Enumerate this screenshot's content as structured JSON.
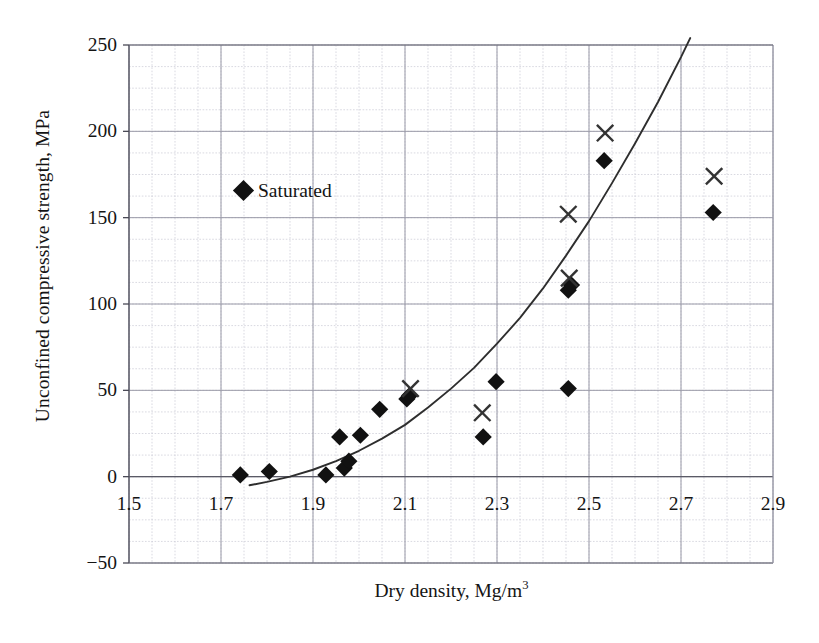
{
  "chart_data": {
    "type": "scatter",
    "title": "",
    "xlabel": "Dry density, Mg/m",
    "xlabel_exponent": "3",
    "ylabel": "Unconfined compressive strength, MPa",
    "xlim": [
      1.5,
      2.9
    ],
    "ylim": [
      -50,
      250
    ],
    "xticks": [
      1.5,
      1.7,
      1.9,
      2.1,
      2.3,
      2.5,
      2.7,
      2.9
    ],
    "xtick_labels": [
      "1.5",
      "1.7",
      "1.9",
      "2.1",
      "2.3",
      "2.5",
      "2.7",
      "2.9"
    ],
    "yticks": [
      -50,
      0,
      50,
      100,
      150,
      200,
      250
    ],
    "ytick_labels": [
      "−50",
      "0",
      "50",
      "100",
      "150",
      "200",
      "250"
    ],
    "grid": true,
    "grid_minor_step_x": 0.05,
    "grid_minor_step_y": 12.5,
    "legend": [
      {
        "label": "Saturated",
        "marker": "diamond",
        "color": "#111111"
      }
    ],
    "legend_position": "inside-upper-left",
    "series": [
      {
        "name": "Saturated",
        "marker": "diamond",
        "color": "#111111",
        "points": [
          {
            "x": 1.742,
            "y": 1
          },
          {
            "x": 1.805,
            "y": 3
          },
          {
            "x": 1.928,
            "y": 1
          },
          {
            "x": 1.968,
            "y": 5
          },
          {
            "x": 1.978,
            "y": 9
          },
          {
            "x": 1.958,
            "y": 23
          },
          {
            "x": 2.003,
            "y": 24
          },
          {
            "x": 2.045,
            "y": 39
          },
          {
            "x": 2.104,
            "y": 45
          },
          {
            "x": 2.11,
            "y": 47
          },
          {
            "x": 2.27,
            "y": 23
          },
          {
            "x": 2.298,
            "y": 55
          },
          {
            "x": 2.455,
            "y": 51
          },
          {
            "x": 2.455,
            "y": 108
          },
          {
            "x": 2.462,
            "y": 111
          },
          {
            "x": 2.533,
            "y": 183
          },
          {
            "x": 2.77,
            "y": 153
          }
        ]
      },
      {
        "name": "Dry",
        "marker": "cross",
        "color": "#333333",
        "points": [
          {
            "x": 2.112,
            "y": 51
          },
          {
            "x": 2.268,
            "y": 37
          },
          {
            "x": 2.455,
            "y": 152
          },
          {
            "x": 2.457,
            "y": 115
          },
          {
            "x": 2.535,
            "y": 199
          },
          {
            "x": 2.772,
            "y": 174
          }
        ]
      }
    ],
    "fit_curve": {
      "name": "trend",
      "type": "power",
      "color": "#2e2e2e",
      "points": [
        {
          "x": 1.762,
          "y": -5
        },
        {
          "x": 1.8,
          "y": -3
        },
        {
          "x": 1.85,
          "y": 0
        },
        {
          "x": 1.9,
          "y": 4
        },
        {
          "x": 1.95,
          "y": 9
        },
        {
          "x": 2.0,
          "y": 15
        },
        {
          "x": 2.05,
          "y": 22
        },
        {
          "x": 2.1,
          "y": 30
        },
        {
          "x": 2.15,
          "y": 40
        },
        {
          "x": 2.2,
          "y": 51
        },
        {
          "x": 2.25,
          "y": 63
        },
        {
          "x": 2.3,
          "y": 77
        },
        {
          "x": 2.35,
          "y": 92
        },
        {
          "x": 2.4,
          "y": 109
        },
        {
          "x": 2.45,
          "y": 128
        },
        {
          "x": 2.5,
          "y": 148
        },
        {
          "x": 2.55,
          "y": 170
        },
        {
          "x": 2.6,
          "y": 193
        },
        {
          "x": 2.65,
          "y": 217
        },
        {
          "x": 2.7,
          "y": 243
        },
        {
          "x": 2.72,
          "y": 254
        }
      ]
    }
  },
  "caption": ""
}
